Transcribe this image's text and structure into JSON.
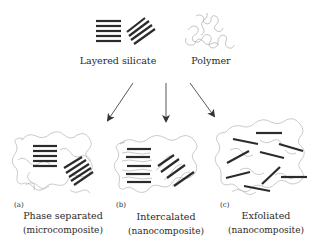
{
  "diagram": {
    "sources": [
      {
        "id": "layered-silicate",
        "label": "Layered silicate"
      },
      {
        "id": "polymer",
        "label": "Polymer"
      }
    ],
    "outcomes": [
      {
        "id": "a",
        "tag": "(a)",
        "label": "Phase separated",
        "sublabel": "(microcomposite)"
      },
      {
        "id": "b",
        "tag": "(b)",
        "label": "Intercalated",
        "sublabel": "(nanocomposite)"
      },
      {
        "id": "c",
        "tag": "(c)",
        "label": "Exfoliated",
        "sublabel": "(nanocomposite)"
      }
    ],
    "colors": {
      "layer": "#2b2b2b",
      "polymer": "#b8b8b8",
      "arrow": "#444444",
      "text": "#2a2a2a"
    }
  }
}
